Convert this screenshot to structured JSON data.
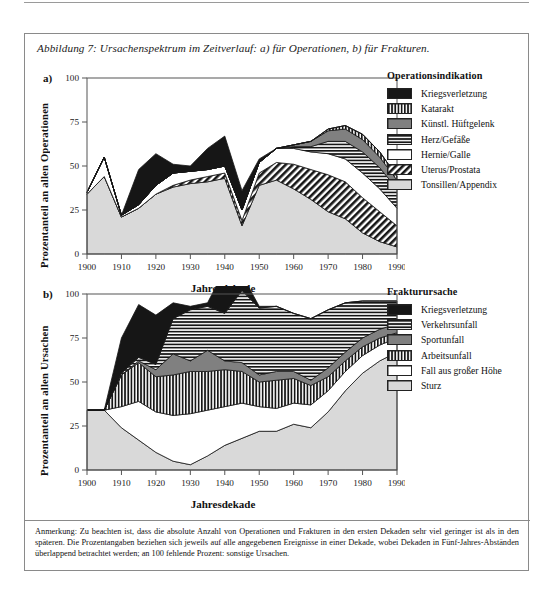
{
  "caption": "Abbildung 7: Ursachenspektrum im Zeitverlauf: a) für Operationen, b) für Frakturen.",
  "note": "Anmerkung: Zu beachten ist, dass die absolute Anzahl von Operationen und Frakturen in den ersten Dekaden sehr viel geringer ist als in den späteren. Die Prozentangaben beziehen sich jeweils auf alle angegebenen Ereignisse in einer Dekade, wobei Dekaden in Fünf-Jahres-Abständen überlappend betrachtet werden; an 100 fehlende Prozent: sonstige Ursachen.",
  "panel_a": {
    "marker": "a)",
    "ylabel": "Prozentanteil an allen Operationen",
    "xlabel": "Jahresdekade",
    "legend_title": "Operationsindikation"
  },
  "panel_b": {
    "marker": "b)",
    "ylabel": "Prozentanteil an allen Ursachen",
    "xlabel": "Jahresdekade",
    "legend_title": "Frakturursache"
  },
  "chart_data": [
    {
      "type": "area",
      "id": "operationen",
      "title": "a) für Operationen",
      "xlabel": "Jahresdekade",
      "ylabel": "Prozentanteil an allen Operationen",
      "legend_title": "Operationsindikation",
      "legend_position": "right",
      "grid": false,
      "stacked": true,
      "xlim": [
        1900,
        1990
      ],
      "ylim": [
        0,
        100
      ],
      "yticks": [
        0,
        25,
        50,
        75,
        100
      ],
      "xticks": [
        1900,
        1910,
        1920,
        1930,
        1940,
        1950,
        1960,
        1970,
        1980,
        1990
      ],
      "x": [
        1900,
        1905,
        1910,
        1915,
        1920,
        1925,
        1930,
        1935,
        1940,
        1945,
        1950,
        1955,
        1960,
        1965,
        1970,
        1975,
        1980,
        1985,
        1990
      ],
      "series": [
        {
          "name": "Tonsillen/Appendix",
          "fill": "lightgray",
          "order": 1,
          "values": [
            34,
            44,
            21,
            26,
            34,
            38,
            40,
            41,
            43,
            16,
            39,
            42,
            37,
            31,
            24,
            20,
            12,
            7,
            4
          ]
        },
        {
          "name": "Uterus/Prostata",
          "fill": "diagonal-hatch",
          "order": 2,
          "values": [
            0,
            0,
            0,
            0,
            0,
            1,
            2,
            3,
            3,
            3,
            7,
            10,
            14,
            17,
            21,
            21,
            20,
            17,
            12
          ]
        },
        {
          "name": "Hernie/Galle",
          "fill": "white",
          "order": 3,
          "values": [
            1,
            11,
            1,
            2,
            5,
            7,
            5,
            4,
            4,
            6,
            6,
            8,
            9,
            10,
            12,
            13,
            14,
            13,
            10
          ]
        },
        {
          "name": "Herz/Gefäße",
          "fill": "horizontal-lines",
          "order": 4,
          "values": [
            0,
            0,
            0,
            0,
            0,
            0,
            0,
            0,
            0,
            0,
            0,
            0,
            1,
            3,
            7,
            10,
            12,
            12,
            11
          ]
        },
        {
          "name": "Künstl. Hüftgelenk",
          "fill": "midgray",
          "order": 5,
          "values": [
            0,
            0,
            0,
            0,
            0,
            0,
            0,
            0,
            0,
            0,
            0,
            0,
            1,
            3,
            6,
            7,
            7,
            6,
            5
          ]
        },
        {
          "name": "Katarakt",
          "fill": "vertical-lines",
          "order": 6,
          "values": [
            0,
            0,
            0,
            0,
            0,
            0,
            0,
            0,
            0,
            0,
            0,
            0,
            0,
            0,
            1,
            2,
            3,
            3,
            2
          ]
        },
        {
          "name": "Kriegsverletzung",
          "fill": "black",
          "order": 7,
          "values": [
            0,
            0,
            0,
            20,
            18,
            5,
            3,
            12,
            17,
            11,
            2,
            0,
            0,
            0,
            0,
            0,
            0,
            0,
            0
          ]
        }
      ]
    },
    {
      "type": "area",
      "id": "frakturen",
      "title": "b) für Frakturen",
      "xlabel": "Jahresdekade",
      "ylabel": "Prozentanteil an allen Ursachen",
      "legend_title": "Frakturursache",
      "legend_position": "right",
      "grid": false,
      "stacked": true,
      "xlim": [
        1900,
        1990
      ],
      "ylim": [
        0,
        100
      ],
      "yticks": [
        0,
        25,
        50,
        75,
        100
      ],
      "xticks": [
        1900,
        1910,
        1920,
        1930,
        1940,
        1950,
        1960,
        1970,
        1980,
        1990
      ],
      "x": [
        1900,
        1905,
        1910,
        1915,
        1920,
        1925,
        1930,
        1935,
        1940,
        1945,
        1950,
        1955,
        1960,
        1965,
        1970,
        1975,
        1980,
        1985,
        1990
      ],
      "series": [
        {
          "name": "Sturz",
          "fill": "lightgray",
          "order": 1,
          "values": [
            34,
            34,
            24,
            17,
            10,
            5,
            3,
            8,
            14,
            18,
            22,
            22,
            26,
            24,
            33,
            45,
            55,
            62,
            67
          ]
        },
        {
          "name": "Fall aus großer Höhe",
          "fill": "white",
          "order": 2,
          "values": [
            0,
            0,
            12,
            22,
            23,
            26,
            29,
            26,
            22,
            20,
            14,
            13,
            12,
            13,
            12,
            11,
            10,
            9,
            8
          ]
        },
        {
          "name": "Arbeitsunfall",
          "fill": "vertical-lines",
          "order": 3,
          "values": [
            0,
            0,
            18,
            22,
            20,
            23,
            24,
            22,
            21,
            18,
            14,
            16,
            14,
            11,
            8,
            6,
            5,
            4,
            3
          ]
        },
        {
          "name": "Sportunfall",
          "fill": "midgray",
          "order": 4,
          "values": [
            0,
            0,
            0,
            1,
            4,
            12,
            6,
            12,
            5,
            5,
            4,
            5,
            4,
            3,
            5,
            5,
            5,
            5,
            5
          ]
        },
        {
          "name": "Verkehrsunfall",
          "fill": "horizontal-lines",
          "order": 5,
          "values": [
            0,
            0,
            1,
            2,
            3,
            20,
            29,
            25,
            27,
            41,
            38,
            37,
            33,
            35,
            33,
            28,
            21,
            16,
            13
          ]
        },
        {
          "name": "Kriegsverletzung",
          "fill": "black",
          "order": 6,
          "values": [
            0,
            0,
            20,
            30,
            28,
            9,
            2,
            2,
            25,
            9,
            1,
            0,
            0,
            0,
            0,
            0,
            0,
            0,
            0
          ]
        }
      ]
    }
  ],
  "legend_a": [
    {
      "label": "Kriegsverletzung",
      "fill": "black"
    },
    {
      "label": "Katarakt",
      "fill": "vertical-lines"
    },
    {
      "label": "Künstl. Hüftgelenk",
      "fill": "midgray"
    },
    {
      "label": "Herz/Gefäße",
      "fill": "horizontal-lines"
    },
    {
      "label": "Hernie/Galle",
      "fill": "white"
    },
    {
      "label": "Uterus/Prostata",
      "fill": "diagonal-hatch"
    },
    {
      "label": "Tonsillen/Appendix",
      "fill": "lightgray"
    }
  ],
  "legend_b": [
    {
      "label": "Kriegsverletzung",
      "fill": "black"
    },
    {
      "label": "Verkehrsunfall",
      "fill": "horizontal-lines"
    },
    {
      "label": "Sportunfall",
      "fill": "midgray"
    },
    {
      "label": "Arbeitsunfall",
      "fill": "vertical-lines"
    },
    {
      "label": "Fall aus großer Höhe",
      "fill": "white"
    },
    {
      "label": "Sturz",
      "fill": "lightgray"
    }
  ],
  "colors": {
    "black": "#161616",
    "midgray": "#808080",
    "lightgray": "#d9d9d9",
    "white": "#ffffff",
    "axis": "#555555"
  }
}
